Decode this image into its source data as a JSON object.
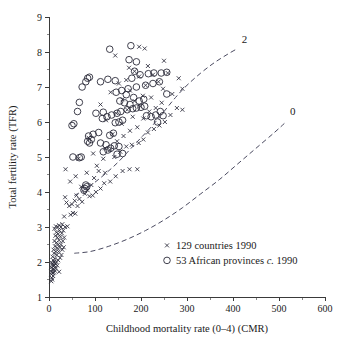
{
  "chart_data": {
    "type": "scatter",
    "title": "",
    "xlabel": "Childhood mortality rate (0–4) (CMR)",
    "ylabel": "Total fertility rate (TFR)",
    "xlim": [
      0,
      600
    ],
    "ylim": [
      1,
      9
    ],
    "xticks": [
      0,
      100,
      200,
      300,
      400,
      500,
      600
    ],
    "xtick_labels": [
      "0",
      "100",
      "200",
      "300",
      "400",
      "500",
      "600"
    ],
    "xminor_step": 50,
    "yticks": [
      1,
      2,
      3,
      4,
      5,
      6,
      7,
      8,
      9
    ],
    "ytick_labels": [
      "1",
      "2",
      "3",
      "4",
      "5",
      "6",
      "7",
      "8",
      "9"
    ],
    "yminor_step": 0.5,
    "grid": false,
    "legend_position": "inside-lower-right",
    "series": [
      {
        "name": "129 countries 1990",
        "marker": "cross",
        "points": [
          [
            5,
            1.45
          ],
          [
            7,
            1.5
          ],
          [
            6,
            1.55
          ],
          [
            9,
            1.6
          ],
          [
            5,
            1.65
          ],
          [
            8,
            1.68
          ],
          [
            11,
            1.7
          ],
          [
            6,
            1.72
          ],
          [
            13,
            1.75
          ],
          [
            7,
            1.78
          ],
          [
            10,
            1.8
          ],
          [
            15,
            1.82
          ],
          [
            5,
            1.85
          ],
          [
            9,
            1.88
          ],
          [
            12,
            1.9
          ],
          [
            18,
            1.9
          ],
          [
            7,
            1.93
          ],
          [
            22,
            1.72
          ],
          [
            14,
            1.95
          ],
          [
            6,
            1.98
          ],
          [
            11,
            2.0
          ],
          [
            16,
            2.0
          ],
          [
            9,
            2.05
          ],
          [
            20,
            2.05
          ],
          [
            13,
            2.1
          ],
          [
            8,
            2.15
          ],
          [
            24,
            2.12
          ],
          [
            17,
            2.2
          ],
          [
            11,
            2.25
          ],
          [
            27,
            2.2
          ],
          [
            15,
            2.3
          ],
          [
            21,
            2.3
          ],
          [
            10,
            2.35
          ],
          [
            29,
            2.35
          ],
          [
            18,
            2.4
          ],
          [
            24,
            2.42
          ],
          [
            13,
            2.45
          ],
          [
            32,
            2.42
          ],
          [
            20,
            2.5
          ],
          [
            16,
            2.55
          ],
          [
            26,
            2.5
          ],
          [
            12,
            2.6
          ],
          [
            22,
            2.62
          ],
          [
            30,
            2.6
          ],
          [
            18,
            2.7
          ],
          [
            14,
            2.75
          ],
          [
            25,
            2.72
          ],
          [
            33,
            2.7
          ],
          [
            20,
            2.8
          ],
          [
            16,
            2.85
          ],
          [
            28,
            2.82
          ],
          [
            23,
            2.9
          ],
          [
            12,
            2.95
          ],
          [
            31,
            2.9
          ],
          [
            19,
            3.0
          ],
          [
            26,
            3.0
          ],
          [
            15,
            3.02
          ],
          [
            35,
            3.0
          ],
          [
            22,
            3.05
          ],
          [
            29,
            3.08
          ],
          [
            40,
            3.02
          ],
          [
            33,
            3.3
          ],
          [
            47,
            3.35
          ],
          [
            52,
            3.4
          ],
          [
            57,
            3.38
          ],
          [
            44,
            3.6
          ],
          [
            38,
            3.7
          ],
          [
            50,
            3.65
          ],
          [
            62,
            3.6
          ],
          [
            56,
            3.75
          ],
          [
            35,
            3.85
          ],
          [
            66,
            3.8
          ],
          [
            72,
            3.72
          ],
          [
            88,
            3.88
          ],
          [
            60,
            3.9
          ],
          [
            78,
            3.95
          ],
          [
            95,
            3.9
          ],
          [
            84,
            4.05
          ],
          [
            102,
            4.0
          ],
          [
            70,
            4.15
          ],
          [
            92,
            4.2
          ],
          [
            112,
            4.1
          ],
          [
            46,
            4.3
          ],
          [
            120,
            4.25
          ],
          [
            58,
            4.45
          ],
          [
            98,
            4.4
          ],
          [
            133,
            4.3
          ],
          [
            82,
            4.55
          ],
          [
            145,
            4.45
          ],
          [
            160,
            4.6
          ],
          [
            36,
            4.65
          ],
          [
            108,
            4.6
          ],
          [
            122,
            4.55
          ],
          [
            175,
            4.65
          ],
          [
            192,
            4.65
          ],
          [
            64,
            4.95
          ],
          [
            118,
            4.95
          ],
          [
            142,
            5.0
          ],
          [
            96,
            5.1
          ],
          [
            155,
            5.15
          ],
          [
            132,
            5.2
          ],
          [
            168,
            5.3
          ],
          [
            180,
            5.35
          ],
          [
            148,
            5.45
          ],
          [
            195,
            5.4
          ],
          [
            86,
            5.55
          ],
          [
            205,
            5.5
          ],
          [
            162,
            5.6
          ],
          [
            138,
            5.65
          ],
          [
            215,
            5.7
          ],
          [
            176,
            5.75
          ],
          [
            228,
            5.8
          ],
          [
            192,
            5.85
          ],
          [
            240,
            5.9
          ],
          [
            158,
            5.95
          ],
          [
            252,
            6.0
          ],
          [
            124,
            6.05
          ],
          [
            205,
            6.1
          ],
          [
            182,
            6.15
          ],
          [
            264,
            6.2
          ],
          [
            146,
            6.25
          ],
          [
            218,
            6.3
          ],
          [
            170,
            6.35
          ],
          [
            232,
            6.4
          ],
          [
            198,
            6.45
          ],
          [
            278,
            6.4
          ],
          [
            112,
            6.5
          ],
          [
            245,
            6.55
          ],
          [
            186,
            6.6
          ],
          [
            160,
            6.65
          ],
          [
            222,
            6.7
          ],
          [
            204,
            6.75
          ],
          [
            268,
            6.8
          ],
          [
            134,
            6.85
          ],
          [
            176,
            6.9
          ],
          [
            248,
            6.95
          ],
          [
            290,
            6.95
          ],
          [
            210,
            7.05
          ],
          [
            152,
            7.1
          ],
          [
            238,
            7.15
          ],
          [
            168,
            7.2
          ],
          [
            282,
            7.25
          ],
          [
            196,
            7.3
          ],
          [
            226,
            7.35
          ],
          [
            258,
            7.4
          ],
          [
            186,
            7.45
          ],
          [
            174,
            7.55
          ],
          [
            215,
            7.6
          ],
          [
            250,
            7.75
          ],
          [
            144,
            7.9
          ],
          [
            196,
            8.15
          ],
          [
            208,
            8.1
          ],
          [
            290,
            6.35
          ],
          [
            122,
            5.25
          ],
          [
            104,
            4.75
          ]
        ]
      },
      {
        "name": "53 African provinces c. 1990",
        "marker": "circle",
        "points": [
          [
            78,
            4.1
          ],
          [
            82,
            4.15
          ],
          [
            80,
            4.2
          ],
          [
            76,
            4.05
          ],
          [
            52,
            5.0
          ],
          [
            66,
            4.98
          ],
          [
            70,
            5.0
          ],
          [
            118,
            5.15
          ],
          [
            128,
            5.2
          ],
          [
            134,
            5.25
          ],
          [
            124,
            5.35
          ],
          [
            112,
            5.4
          ],
          [
            88,
            5.4
          ],
          [
            84,
            5.45
          ],
          [
            92,
            5.5
          ],
          [
            86,
            5.6
          ],
          [
            96,
            5.65
          ],
          [
            108,
            5.7
          ],
          [
            140,
            5.68
          ],
          [
            132,
            5.62
          ],
          [
            50,
            5.9
          ],
          [
            54,
            5.95
          ],
          [
            144,
            5.98
          ],
          [
            152,
            6.0
          ],
          [
            160,
            6.05
          ],
          [
            116,
            6.1
          ],
          [
            126,
            6.15
          ],
          [
            136,
            6.2
          ],
          [
            148,
            6.25
          ],
          [
            156,
            6.3
          ],
          [
            170,
            6.35
          ],
          [
            182,
            6.38
          ],
          [
            190,
            6.4
          ],
          [
            200,
            6.42
          ],
          [
            212,
            6.18
          ],
          [
            222,
            6.15
          ],
          [
            232,
            6.2
          ],
          [
            242,
            6.3
          ],
          [
            208,
            6.45
          ],
          [
            176,
            6.5
          ],
          [
            164,
            6.55
          ],
          [
            154,
            6.6
          ],
          [
            196,
            6.6
          ],
          [
            206,
            6.65
          ],
          [
            184,
            6.7
          ],
          [
            168,
            6.78
          ],
          [
            146,
            6.85
          ],
          [
            158,
            6.9
          ],
          [
            172,
            6.95
          ],
          [
            190,
            7.0
          ],
          [
            210,
            7.05
          ],
          [
            226,
            7.1
          ],
          [
            240,
            7.15
          ],
          [
            72,
            7.0
          ],
          [
            80,
            7.15
          ],
          [
            84,
            7.25
          ],
          [
            88,
            7.28
          ],
          [
            112,
            7.15
          ],
          [
            128,
            7.22
          ],
          [
            144,
            7.18
          ],
          [
            180,
            7.25
          ],
          [
            198,
            7.35
          ],
          [
            216,
            7.38
          ],
          [
            228,
            7.4
          ],
          [
            244,
            7.4
          ],
          [
            256,
            7.42
          ],
          [
            186,
            7.45
          ],
          [
            174,
            7.78
          ],
          [
            190,
            7.72
          ],
          [
            132,
            8.08
          ],
          [
            178,
            8.18
          ],
          [
            66,
            6.56
          ],
          [
            62,
            6.3
          ],
          [
            102,
            6.25
          ],
          [
            118,
            6.28
          ],
          [
            148,
            5.08
          ],
          [
            160,
            5.1
          ],
          [
            152,
            5.3
          ],
          [
            142,
            5.32
          ],
          [
            236,
            6.0
          ],
          [
            248,
            6.18
          ],
          [
            256,
            6.8
          ]
        ]
      }
    ],
    "curves": [
      {
        "label": "2",
        "style": "dashed",
        "description": "Upper dashed reference curve labelled 2",
        "points": [
          [
            55,
            3.9
          ],
          [
            75,
            4.05
          ],
          [
            100,
            4.28
          ],
          [
            125,
            4.55
          ],
          [
            150,
            4.85
          ],
          [
            175,
            5.2
          ],
          [
            200,
            5.55
          ],
          [
            225,
            5.9
          ],
          [
            250,
            6.3
          ],
          [
            275,
            6.7
          ],
          [
            300,
            7.05
          ],
          [
            330,
            7.4
          ],
          [
            360,
            7.7
          ],
          [
            390,
            7.95
          ],
          [
            410,
            8.1
          ]
        ]
      },
      {
        "label": "0",
        "style": "dashed",
        "description": "Lower dashed reference curve labelled 0",
        "points": [
          [
            55,
            2.25
          ],
          [
            90,
            2.3
          ],
          [
            130,
            2.45
          ],
          [
            170,
            2.65
          ],
          [
            210,
            2.9
          ],
          [
            250,
            3.2
          ],
          [
            290,
            3.55
          ],
          [
            330,
            3.95
          ],
          [
            370,
            4.35
          ],
          [
            410,
            4.8
          ],
          [
            450,
            5.25
          ],
          [
            490,
            5.7
          ],
          [
            515,
            6.0
          ]
        ]
      }
    ],
    "curve_labels": [
      {
        "text": "2",
        "cmr": 425,
        "tfr": 8.25
      },
      {
        "text": "0",
        "cmr": 530,
        "tfr": 6.2
      }
    ],
    "legend_entries": [
      {
        "marker": "cross",
        "label": "129 countries 1990"
      },
      {
        "marker": "circle",
        "label_prefix": "53 African provinces ",
        "label_italic": "c.",
        "label_suffix": " 1990"
      }
    ]
  },
  "colors": {
    "background": "#ffffff",
    "axis": "#3a3a3a",
    "marker": "#2b2b3a",
    "curve": "#4a4a60",
    "text": "#1a1a1a"
  }
}
